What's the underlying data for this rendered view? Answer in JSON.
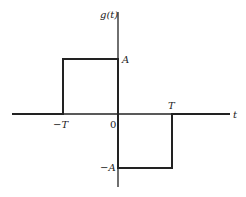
{
  "diagram": {
    "type": "signal-waveform",
    "function_label": "g(t)",
    "x_axis_label": "t",
    "labels": {
      "amplitude_pos": "A",
      "amplitude_neg": "−A",
      "time_neg": "−T",
      "origin": "0",
      "time_pos": "T"
    },
    "segments": [
      {
        "t_start": "-inf",
        "t_end": "-T",
        "value": "0"
      },
      {
        "t_start": "-T",
        "t_end": "0",
        "value": "A"
      },
      {
        "t_start": "0",
        "t_end": "T",
        "value": "-A"
      },
      {
        "t_start": "T",
        "t_end": "inf",
        "value": "0"
      }
    ],
    "colors": {
      "line": "#222222",
      "background": "#ffffff"
    }
  }
}
